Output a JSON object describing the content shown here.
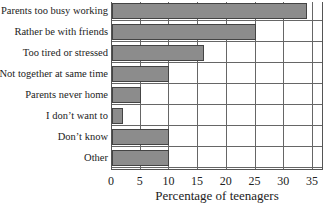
{
  "chart_data": {
    "type": "bar",
    "orientation": "horizontal",
    "title": "",
    "categories": [
      "Parents too busy working",
      "Rather be with friends",
      "Too tired or stressed",
      "Not together at same time",
      "Parents never home",
      "I don’t want to",
      "Don’t know",
      "Other"
    ],
    "values": [
      34,
      25,
      16,
      10,
      5,
      2,
      10,
      10
    ],
    "xlabel": "Percentage of teenagers",
    "ylabel": "",
    "xlim": [
      0,
      37
    ],
    "xticks": [
      "0",
      "5",
      "10",
      "15",
      "20",
      "25",
      "30",
      "35"
    ],
    "grid": true,
    "legend": null,
    "bar_color": "#8c8c8c"
  }
}
